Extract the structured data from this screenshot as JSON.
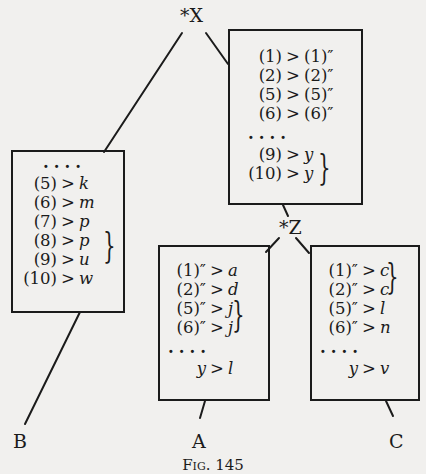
{
  "diagram": {
    "nodes": {
      "X": {
        "label": "*X"
      },
      "Z": {
        "label": "*Z"
      },
      "A": {
        "label": "A"
      },
      "B": {
        "label": "B"
      },
      "C": {
        "label": "C"
      }
    },
    "boxes": {
      "x_box": {
        "rows": [
          {
            "lhs": "(1)",
            "op": ">",
            "rhs": "(1)″"
          },
          {
            "lhs": "(2)",
            "op": ">",
            "rhs": "(2)″"
          },
          {
            "lhs": "(5)",
            "op": ">",
            "rhs": "(5)″"
          },
          {
            "lhs": "(6)",
            "op": ">",
            "rhs": "(6)″"
          },
          {
            "dots": "...."
          },
          {
            "lhs": "(9)",
            "op": ">",
            "rhs": "y"
          },
          {
            "lhs": "(10)",
            "op": ">",
            "rhs": "y"
          }
        ],
        "brace": "}"
      },
      "b_box": {
        "rows": [
          {
            "dots": "...."
          },
          {
            "lhs": "(5)",
            "op": ">",
            "rhs": "k"
          },
          {
            "lhs": "(6)",
            "op": ">",
            "rhs": "m"
          },
          {
            "lhs": "(7)",
            "op": ">",
            "rhs": "p"
          },
          {
            "lhs": "(8)",
            "op": ">",
            "rhs": "p"
          },
          {
            "lhs": "(9)",
            "op": ">",
            "rhs": "u"
          },
          {
            "lhs": "(10)",
            "op": ">",
            "rhs": "w"
          }
        ],
        "brace": "}"
      },
      "a_box": {
        "rows": [
          {
            "lhs": "(1)″",
            "op": ">",
            "rhs": "a"
          },
          {
            "lhs": "(2)″",
            "op": ">",
            "rhs": "d"
          },
          {
            "lhs": "(5)″",
            "op": ">",
            "rhs": "j"
          },
          {
            "lhs": "(6)″",
            "op": ">",
            "rhs": "j"
          },
          {
            "dots": "...."
          },
          {
            "lhs": "y",
            "op": ">",
            "rhs": "l"
          }
        ],
        "brace": "}"
      },
      "c_box": {
        "rows": [
          {
            "lhs": "(1)″",
            "op": ">",
            "rhs": "c"
          },
          {
            "lhs": "(2)″",
            "op": ">",
            "rhs": "c"
          },
          {
            "lhs": "(5)″",
            "op": ">",
            "rhs": "l"
          },
          {
            "lhs": "(6)″",
            "op": ">",
            "rhs": "n"
          },
          {
            "dots": "...."
          },
          {
            "lhs": "y",
            "op": ">",
            "rhs": "v"
          }
        ],
        "brace": "}"
      }
    },
    "caption": "Fig. 145"
  }
}
